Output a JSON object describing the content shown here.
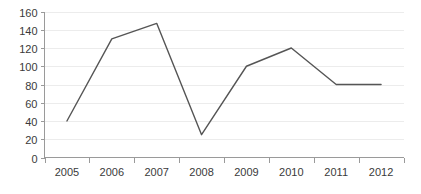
{
  "chart_data": {
    "type": "line",
    "title": "",
    "subtitle": "",
    "xlabel": "",
    "ylabel": "",
    "categories": [
      "2005",
      "2006",
      "2007",
      "2008",
      "2009",
      "2010",
      "2011",
      "2012"
    ],
    "values": [
      40,
      130,
      147,
      25,
      100,
      120,
      80,
      80
    ],
    "series": [
      {
        "name": "",
        "values": [
          40,
          130,
          147,
          25,
          100,
          120,
          80,
          80
        ],
        "color": "#555555"
      }
    ],
    "ylim": [
      0,
      160
    ],
    "ytick_labels": [
      "0",
      "20",
      "40",
      "60",
      "80",
      "100",
      "120",
      "140",
      "160"
    ],
    "ytick_values": [
      0,
      20,
      40,
      60,
      80,
      100,
      120,
      140,
      160
    ],
    "xtick_labels": [
      "2005",
      "2006",
      "2007",
      "2008",
      "2009",
      "2010",
      "2011",
      "2012"
    ],
    "grid": true,
    "grid_axis": "y",
    "grid_color": "#ececec",
    "axis_color": "#9a9a9a",
    "legend": false,
    "legend_position": "none",
    "markers": false,
    "background_color": "#ffffff",
    "tick_label_color": "#3a3a3a"
  }
}
